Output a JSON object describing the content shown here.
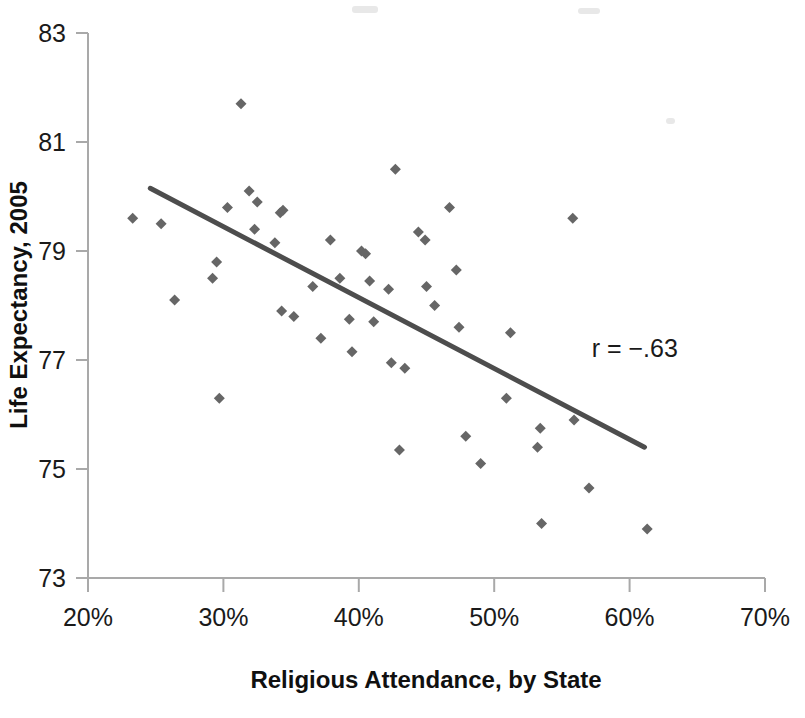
{
  "chart_data": {
    "type": "scatter",
    "title": "",
    "xlabel": "Religious Attendance, by State",
    "ylabel": "Life Expectancy, 2005",
    "xlim": [
      20,
      70
    ],
    "ylim": [
      73,
      83
    ],
    "xticks": [
      "20%",
      "30%",
      "40%",
      "50%",
      "60%",
      "70%"
    ],
    "xtick_values": [
      20,
      30,
      40,
      50,
      60,
      70
    ],
    "yticks": [
      "73",
      "75",
      "77",
      "79",
      "81",
      "83"
    ],
    "ytick_values": [
      73,
      75,
      77,
      79,
      81,
      83
    ],
    "grid": false,
    "legend": null,
    "annotation": "r = −.63",
    "annotation_x": 57.2,
    "annotation_y": 77.05,
    "marker": "diamond",
    "marker_color": "#666666",
    "marker_size": 11,
    "trendline": {
      "label": "linear fit",
      "color": "#4d4d4d",
      "width": 5,
      "x_start": 24.6,
      "y_start": 80.15,
      "x_end": 61.1,
      "y_end": 75.4
    },
    "points": [
      {
        "x": 23.3,
        "y": 79.6
      },
      {
        "x": 25.4,
        "y": 79.5
      },
      {
        "x": 26.4,
        "y": 78.1
      },
      {
        "x": 29.2,
        "y": 78.5
      },
      {
        "x": 29.5,
        "y": 78.8
      },
      {
        "x": 29.7,
        "y": 76.3
      },
      {
        "x": 30.3,
        "y": 79.8
      },
      {
        "x": 31.3,
        "y": 81.7
      },
      {
        "x": 31.9,
        "y": 80.1
      },
      {
        "x": 32.3,
        "y": 79.4
      },
      {
        "x": 32.5,
        "y": 79.9
      },
      {
        "x": 33.8,
        "y": 79.15
      },
      {
        "x": 34.2,
        "y": 79.7
      },
      {
        "x": 34.4,
        "y": 79.75
      },
      {
        "x": 34.3,
        "y": 77.9
      },
      {
        "x": 35.2,
        "y": 77.8
      },
      {
        "x": 36.6,
        "y": 78.35
      },
      {
        "x": 37.2,
        "y": 77.4
      },
      {
        "x": 37.9,
        "y": 79.2
      },
      {
        "x": 38.6,
        "y": 78.5
      },
      {
        "x": 39.3,
        "y": 77.75
      },
      {
        "x": 39.5,
        "y": 77.15
      },
      {
        "x": 40.2,
        "y": 79.0
      },
      {
        "x": 40.5,
        "y": 78.95
      },
      {
        "x": 40.8,
        "y": 78.45
      },
      {
        "x": 41.1,
        "y": 77.7
      },
      {
        "x": 42.2,
        "y": 78.3
      },
      {
        "x": 42.4,
        "y": 76.95
      },
      {
        "x": 42.7,
        "y": 80.5
      },
      {
        "x": 43.0,
        "y": 75.35
      },
      {
        "x": 43.4,
        "y": 76.85
      },
      {
        "x": 44.4,
        "y": 79.35
      },
      {
        "x": 44.9,
        "y": 79.2
      },
      {
        "x": 45.0,
        "y": 78.35
      },
      {
        "x": 45.6,
        "y": 78.0
      },
      {
        "x": 46.7,
        "y": 79.8
      },
      {
        "x": 47.2,
        "y": 78.65
      },
      {
        "x": 47.4,
        "y": 77.6
      },
      {
        "x": 47.9,
        "y": 75.6
      },
      {
        "x": 49.0,
        "y": 75.1
      },
      {
        "x": 50.9,
        "y": 76.3
      },
      {
        "x": 51.2,
        "y": 77.5
      },
      {
        "x": 53.2,
        "y": 75.4
      },
      {
        "x": 53.4,
        "y": 75.75
      },
      {
        "x": 53.5,
        "y": 74.0
      },
      {
        "x": 55.8,
        "y": 79.6
      },
      {
        "x": 55.9,
        "y": 75.9
      },
      {
        "x": 57.0,
        "y": 74.65
      },
      {
        "x": 61.3,
        "y": 73.9
      }
    ]
  },
  "axis_style": {
    "axis_color": "#a9a9a9",
    "tick_color": "#a9a9a9",
    "background": "#ffffff"
  }
}
